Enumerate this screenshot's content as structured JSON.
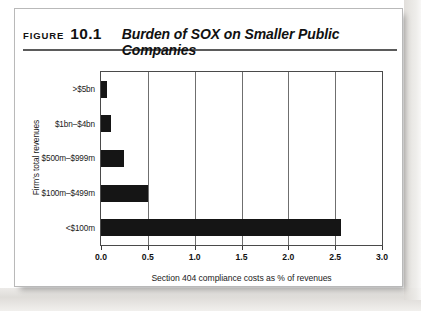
{
  "figure": {
    "label_word": "Figure",
    "number": "10.1",
    "title": "Burden of SOX on Smaller Public Companies"
  },
  "chart_data": {
    "type": "bar",
    "orientation": "horizontal",
    "title": "Burden of SOX on Smaller Public Companies",
    "categories": [
      ">$5bn",
      "$1bn–$4bn",
      "$500m–$999m",
      "$100m–$499m",
      "<$100m"
    ],
    "values": [
      0.06,
      0.11,
      0.25,
      0.5,
      2.56
    ],
    "xlabel": "Section 404 compliance costs as % of revenues",
    "ylabel": "Firm's total revenues",
    "xlim": [
      0.0,
      3.0
    ],
    "xticks": [
      "0.0",
      "0.5",
      "1.0",
      "1.5",
      "2.0",
      "2.5",
      "3.0"
    ],
    "xtick_values": [
      0.0,
      0.5,
      1.0,
      1.5,
      2.0,
      2.5,
      3.0
    ],
    "grid": "vertical",
    "legend": null,
    "bar_color": "#151515",
    "axis_color": "#4a4a4a"
  }
}
